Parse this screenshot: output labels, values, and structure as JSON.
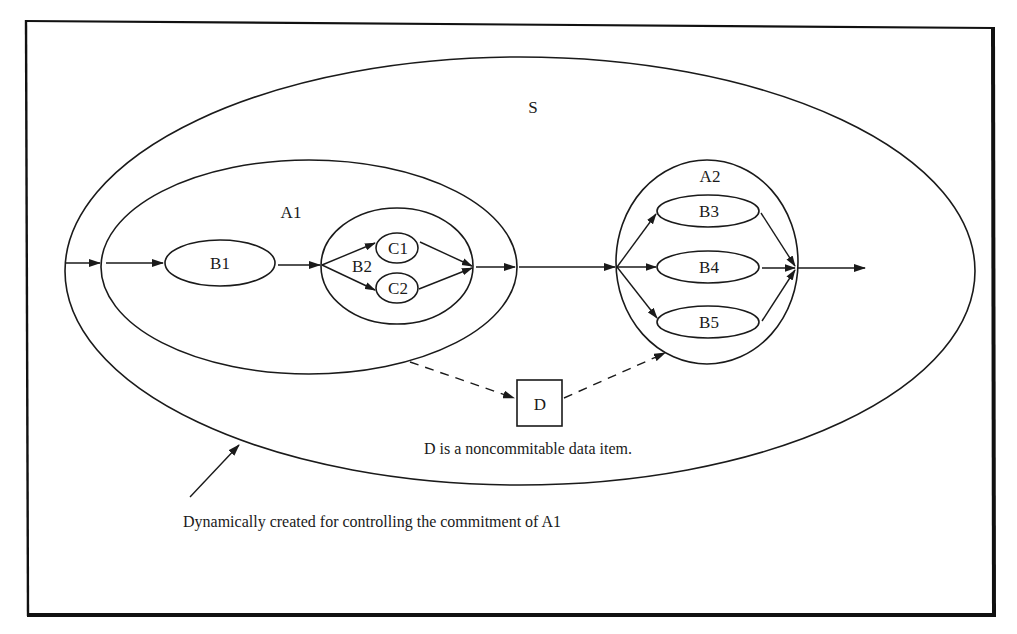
{
  "diagram": {
    "type": "nested-transaction-flow",
    "colors": {
      "ink": "#1a1a1a",
      "background": "#ffffff"
    },
    "regions": {
      "S": {
        "label": "S"
      },
      "A1": {
        "label": "A1"
      },
      "A2": {
        "label": "A2"
      },
      "B2": {
        "label": "B2"
      }
    },
    "nodes": {
      "B1": {
        "label": "B1"
      },
      "C1": {
        "label": "C1"
      },
      "C2": {
        "label": "C2"
      },
      "B3": {
        "label": "B3"
      },
      "B4": {
        "label": "B4"
      },
      "B5": {
        "label": "B5"
      },
      "D": {
        "label": "D",
        "shape": "square"
      }
    },
    "edges": [
      {
        "from": "input",
        "to": "A1",
        "style": "solid"
      },
      {
        "from": "A1-entry",
        "to": "B1",
        "style": "solid"
      },
      {
        "from": "B1",
        "to": "B2",
        "style": "solid"
      },
      {
        "from": "B2-entry",
        "to": "C1",
        "style": "solid"
      },
      {
        "from": "B2-entry",
        "to": "C2",
        "style": "solid"
      },
      {
        "from": "C1",
        "to": "B2-exit",
        "style": "solid"
      },
      {
        "from": "C2",
        "to": "B2-exit",
        "style": "solid"
      },
      {
        "from": "B2-exit",
        "to": "A1-exit",
        "style": "solid"
      },
      {
        "from": "A1-exit",
        "to": "A2",
        "style": "solid"
      },
      {
        "from": "A2-entry",
        "to": "B3",
        "style": "solid"
      },
      {
        "from": "A2-entry",
        "to": "B4",
        "style": "solid"
      },
      {
        "from": "A2-entry",
        "to": "B5",
        "style": "solid"
      },
      {
        "from": "B3",
        "to": "A2-exit",
        "style": "solid"
      },
      {
        "from": "B4",
        "to": "A2-exit",
        "style": "solid"
      },
      {
        "from": "B5",
        "to": "A2-exit",
        "style": "solid"
      },
      {
        "from": "A2-exit",
        "to": "output",
        "style": "solid"
      },
      {
        "from": "A1",
        "to": "D",
        "style": "dashed"
      },
      {
        "from": "D",
        "to": "A2",
        "style": "dashed"
      }
    ],
    "annotations": {
      "d_note": "D is a noncommitable data item.",
      "s_note": "Dynamically created for controlling the commitment of A1"
    }
  }
}
